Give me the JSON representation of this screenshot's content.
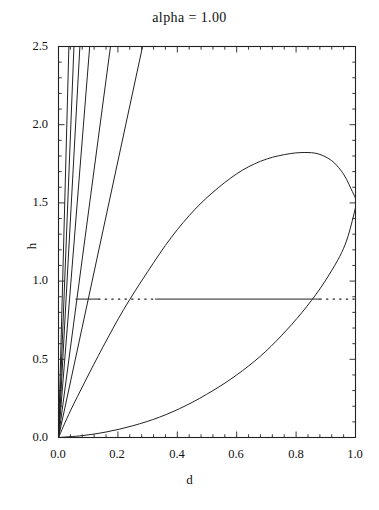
{
  "chart_data": {
    "type": "line",
    "title": "alpha =  1.00",
    "xlabel": "d",
    "ylabel": "h",
    "xlim": [
      0.0,
      1.0
    ],
    "ylim": [
      0.0,
      2.5
    ],
    "xticks": [
      "0.0",
      "0.2",
      "0.4",
      "0.6",
      "0.8",
      "1.0"
    ],
    "xtick_values": [
      0.0,
      0.2,
      0.4,
      0.6,
      0.8,
      1.0
    ],
    "yticks": [
      "0.0",
      "0.5",
      "1.0",
      "1.5",
      "2.0",
      "2.5"
    ],
    "ytick_values": [
      0.0,
      0.5,
      1.0,
      1.5,
      2.0,
      2.5
    ],
    "grid": false,
    "legend": null,
    "frame": "box",
    "minor_ticks": true,
    "line_color": "#222222",
    "series": [
      {
        "name": "ray-1",
        "style": "solid",
        "points": [
          [
            0.0,
            0.0
          ],
          [
            0.035,
            2.5
          ]
        ]
      },
      {
        "name": "ray-2",
        "style": "solid",
        "points": [
          [
            0.0,
            0.0
          ],
          [
            0.052,
            2.5
          ]
        ]
      },
      {
        "name": "ray-3",
        "style": "solid",
        "points": [
          [
            0.0,
            0.0
          ],
          [
            0.072,
            2.5
          ]
        ]
      },
      {
        "name": "ray-4",
        "style": "solid",
        "points": [
          [
            0.0,
            0.0
          ],
          [
            0.105,
            2.5
          ]
        ]
      },
      {
        "name": "ray-5",
        "style": "solid",
        "points": [
          [
            0.0,
            0.0
          ],
          [
            0.175,
            2.5
          ]
        ]
      },
      {
        "name": "ray-6",
        "style": "solid",
        "points": [
          [
            0.0,
            0.0
          ],
          [
            0.283,
            2.5
          ]
        ]
      },
      {
        "name": "loop-upper-branch",
        "style": "solid",
        "points": [
          [
            0.0,
            0.0
          ],
          [
            0.04,
            0.17
          ],
          [
            0.09,
            0.36
          ],
          [
            0.15,
            0.58
          ],
          [
            0.22,
            0.82
          ],
          [
            0.3,
            1.06
          ],
          [
            0.38,
            1.28
          ],
          [
            0.46,
            1.46
          ],
          [
            0.54,
            1.6
          ],
          [
            0.62,
            1.71
          ],
          [
            0.7,
            1.78
          ],
          [
            0.78,
            1.815
          ],
          [
            0.84,
            1.822
          ],
          [
            0.88,
            1.81
          ],
          [
            0.92,
            1.77
          ],
          [
            0.95,
            1.71
          ],
          [
            0.97,
            1.65
          ],
          [
            0.985,
            1.59
          ],
          [
            1.0,
            1.53
          ]
        ]
      },
      {
        "name": "loop-lower-branch",
        "style": "solid",
        "points": [
          [
            0.0,
            0.0
          ],
          [
            0.08,
            0.012
          ],
          [
            0.16,
            0.035
          ],
          [
            0.25,
            0.075
          ],
          [
            0.34,
            0.13
          ],
          [
            0.43,
            0.205
          ],
          [
            0.52,
            0.3
          ],
          [
            0.6,
            0.4
          ],
          [
            0.68,
            0.52
          ],
          [
            0.75,
            0.65
          ],
          [
            0.82,
            0.8
          ],
          [
            0.88,
            0.95
          ],
          [
            0.93,
            1.1
          ],
          [
            0.96,
            1.21
          ],
          [
            0.98,
            1.32
          ],
          [
            1.0,
            1.47
          ]
        ]
      },
      {
        "name": "tie-line",
        "style": "mixed-solid-dotted",
        "h_value": 0.885,
        "segments": [
          {
            "style": "solid",
            "x_start": 0.057,
            "x_end": 0.135
          },
          {
            "style": "dotted",
            "x_start": 0.135,
            "x_end": 0.325
          },
          {
            "style": "solid",
            "x_start": 0.325,
            "x_end": 0.88
          },
          {
            "style": "dotted",
            "x_start": 0.88,
            "x_end": 1.0
          }
        ]
      }
    ]
  }
}
